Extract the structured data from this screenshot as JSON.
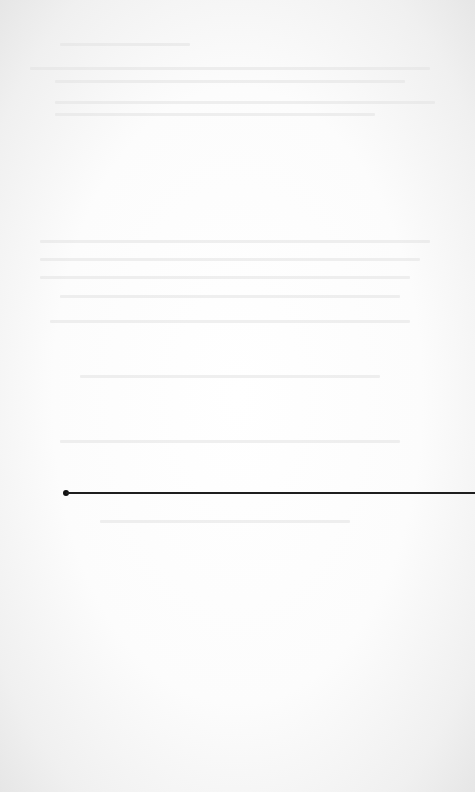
{
  "page": {
    "type": "scanned-blank-page",
    "background_color": "#fbfbfb",
    "bleed_through_text": "illegible"
  },
  "rule": {
    "color": "#1e1e1e",
    "start_marker": "round-dot",
    "y": 492,
    "x_start": 66,
    "x_end": 475
  }
}
